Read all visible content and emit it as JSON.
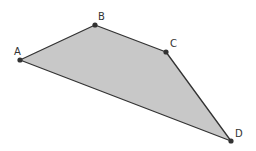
{
  "diagram": {
    "type": "quadrilateral",
    "fill_color": "#c8c8c8",
    "stroke_color": "#333333",
    "point_color": "#333333",
    "vertices": [
      {
        "label": "A",
        "x": 20,
        "y": 60,
        "label_x": 14,
        "label_y": 55
      },
      {
        "label": "B",
        "x": 95,
        "y": 25,
        "label_x": 98,
        "label_y": 20
      },
      {
        "label": "C",
        "x": 166,
        "y": 52,
        "label_x": 170,
        "label_y": 47
      },
      {
        "label": "D",
        "x": 231,
        "y": 141,
        "label_x": 235,
        "label_y": 137
      }
    ]
  }
}
